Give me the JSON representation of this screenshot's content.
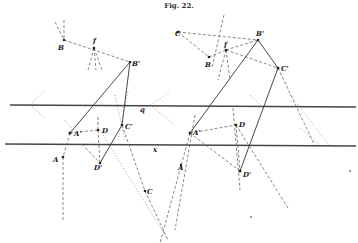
{
  "figure": {
    "title": "Fig. 22.",
    "ground_lines": {
      "upper_label": "q",
      "lower_label": "x"
    },
    "left_construction": {
      "labels": {
        "B": "B",
        "f": "f",
        "B_prime": "B'",
        "A_prime": "A'",
        "A": "A",
        "D": "D",
        "D_prime": "D'",
        "C_prime": "C'",
        "C": "C"
      }
    },
    "right_construction": {
      "labels": {
        "C": "C",
        "f": "f",
        "B": "B",
        "B_prime": "B'",
        "C_prime": "C'",
        "A_prime": "A'",
        "A": "A",
        "D": "D",
        "D_prime": "D'"
      }
    }
  }
}
